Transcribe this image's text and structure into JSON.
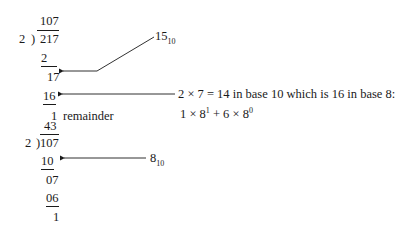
{
  "division1": {
    "quotient": "107",
    "divisor": "2",
    "bracket": ")",
    "dividend": "217",
    "step1_sub": "2",
    "step2_rem": "17",
    "step3_sub": "16",
    "remainder_value": "1",
    "remainder_label": "remainder"
  },
  "division2": {
    "quotient": "43",
    "divisor": "2",
    "bracket": ")",
    "dividend": "107",
    "step1_sub": "10",
    "step2_rem": "07",
    "step3_sub": "06",
    "remainder_value": "1"
  },
  "annotations": {
    "a1_base": "15",
    "a1_sub": "10",
    "a2_line1": "2 × 7 = 14 in base 10 which is 16 in base 8:",
    "a2_line2_p1": "1 × 8",
    "a2_line2_e1": "1",
    "a2_line2_p2": " + 6 × 8",
    "a2_line2_e2": "0",
    "a3_base": "8",
    "a3_sub": "10"
  }
}
